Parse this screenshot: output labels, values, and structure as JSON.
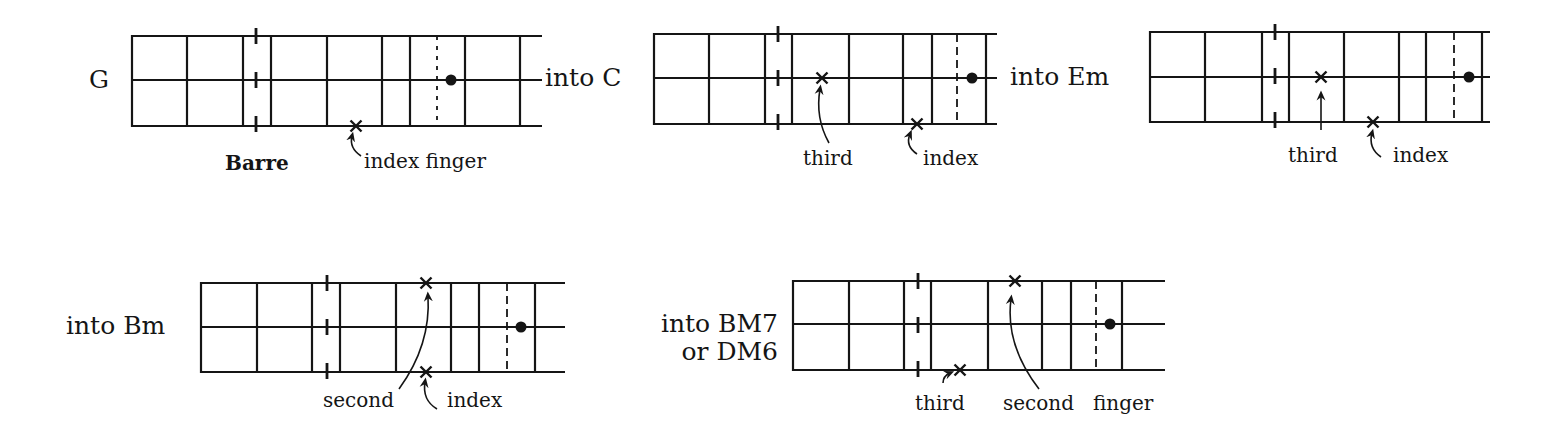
{
  "figure": {
    "stroke_color": "#151515",
    "background": "#ffffff",
    "diagrams": [
      {
        "id": "g",
        "chord_label": [
          "G"
        ],
        "label_anchor": "middle",
        "label_x": 99,
        "label_baselines": [
          88
        ],
        "strings_y": [
          36,
          80,
          126
        ],
        "string_x_start": 132,
        "string_x_end": 542,
        "frets_x": [
          132,
          187,
          243,
          271,
          327,
          382,
          410,
          465,
          520
        ],
        "barre_x": 256,
        "dotted_x": 437,
        "dotted_style": "dotted",
        "dot": {
          "x": 451,
          "y": 80
        },
        "crosses": [
          {
            "x": 356,
            "y": 126,
            "finger": "index"
          }
        ],
        "annotations": [
          {
            "text": "Barre",
            "x": 225,
            "y": 170,
            "bold": true
          },
          {
            "text": "index finger",
            "x": 364,
            "y": 168,
            "bold": false
          }
        ],
        "arrows": [
          {
            "d": "M 361 156 Q 349 148 352 136",
            "head": [
              352,
              136
            ]
          }
        ]
      },
      {
        "id": "c",
        "chord_label": [
          "into C"
        ],
        "label_anchor": "start",
        "label_x": 545,
        "label_baselines": [
          86
        ],
        "strings_y": [
          34,
          78,
          124
        ],
        "string_x_start": 654,
        "string_x_end": 997,
        "frets_x": [
          654,
          709,
          765,
          792,
          849,
          903,
          932,
          986
        ],
        "barre_x": 778,
        "dotted_x": 957,
        "dotted_style": "dashed",
        "dot": {
          "x": 972,
          "y": 78
        },
        "crosses": [
          {
            "x": 822,
            "y": 78,
            "finger": "third"
          },
          {
            "x": 917,
            "y": 124,
            "finger": "index"
          }
        ],
        "annotations": [
          {
            "text": "third",
            "x": 803,
            "y": 165,
            "bold": false
          },
          {
            "text": "index",
            "x": 923,
            "y": 165,
            "bold": false
          }
        ],
        "arrows": [
          {
            "d": "M 829 143 Q 815 118 820 89",
            "head": [
              820,
              89
            ]
          },
          {
            "d": "M 917 154 Q 905 146 910 134",
            "head": [
              910,
              134
            ]
          }
        ]
      },
      {
        "id": "em",
        "chord_label": [
          "into Em"
        ],
        "label_anchor": "start",
        "label_x": 1010,
        "label_baselines": [
          85
        ],
        "strings_y": [
          32,
          77,
          122
        ],
        "string_x_start": 1150,
        "string_x_end": 1490,
        "frets_x": [
          1150,
          1205,
          1262,
          1289,
          1344,
          1399,
          1426,
          1482
        ],
        "barre_x": 1275,
        "dotted_x": 1454,
        "dotted_style": "dashed",
        "dot": {
          "x": 1469,
          "y": 77
        },
        "crosses": [
          {
            "x": 1321,
            "y": 77,
            "finger": "third"
          },
          {
            "x": 1373,
            "y": 122,
            "finger": "index"
          }
        ],
        "annotations": [
          {
            "text": "third",
            "x": 1288,
            "y": 162,
            "bold": false
          },
          {
            "text": "index",
            "x": 1393,
            "y": 162,
            "bold": false
          }
        ],
        "arrows": [
          {
            "d": "M 1321 130 L 1321 95",
            "head": [
              1321,
              95
            ]
          },
          {
            "d": "M 1381 157 Q 1368 148 1372 133",
            "head": [
              1372,
              133
            ]
          }
        ]
      },
      {
        "id": "bm",
        "chord_label": [
          "into Bm"
        ],
        "label_anchor": "start",
        "label_x": 66,
        "label_baselines": [
          334
        ],
        "strings_y": [
          283,
          327,
          372
        ],
        "string_x_start": 201,
        "string_x_end": 565,
        "frets_x": [
          201,
          257,
          312,
          340,
          396,
          451,
          479,
          535
        ],
        "barre_x": 327,
        "dotted_x": 507,
        "dotted_style": "dashed",
        "dot": {
          "x": 521,
          "y": 327
        },
        "crosses": [
          {
            "x": 426,
            "y": 283,
            "finger": "second"
          },
          {
            "x": 426,
            "y": 372,
            "finger": "index"
          }
        ],
        "annotations": [
          {
            "text": "second",
            "x": 323,
            "y": 407,
            "bold": false
          },
          {
            "text": "index",
            "x": 447,
            "y": 407,
            "bold": false
          }
        ],
        "arrows": [
          {
            "d": "M 399 389 Q 431 345 428 296",
            "head": [
              428,
              296
            ]
          },
          {
            "d": "M 437 409 Q 422 400 425 382",
            "head": [
              425,
              382
            ]
          }
        ]
      },
      {
        "id": "bm7",
        "chord_label": [
          "into BM7",
          "or DM6"
        ],
        "label_anchor": "end",
        "label_x": 778,
        "label_baselines": [
          332,
          360
        ],
        "strings_y": [
          281,
          324,
          370
        ],
        "string_x_start": 793,
        "string_x_end": 1165,
        "frets_x": [
          793,
          849,
          904,
          931,
          988,
          1042,
          1071,
          1122
        ],
        "barre_x": 918,
        "dotted_x": 1096,
        "dotted_style": "dashed",
        "dot": {
          "x": 1110,
          "y": 324
        },
        "crosses": [
          {
            "x": 1015,
            "y": 281,
            "finger": "second"
          },
          {
            "x": 960,
            "y": 370,
            "finger": "third"
          }
        ],
        "annotations": [
          {
            "text": "third",
            "x": 915,
            "y": 410,
            "bold": false
          },
          {
            "text": "second",
            "x": 1003,
            "y": 410,
            "bold": false
          },
          {
            "text": "finger",
            "x": 1093,
            "y": 410,
            "bold": false
          }
        ],
        "arrows": [
          {
            "d": "M 943 383 Q 943 376 950 373",
            "head": [
              950,
              373
            ]
          },
          {
            "d": "M 1039 389 Q 1005 345 1011 299",
            "head": [
              1011,
              299
            ]
          }
        ]
      }
    ]
  }
}
